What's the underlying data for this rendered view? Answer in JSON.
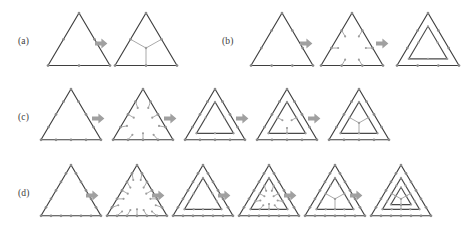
{
  "figure": {
    "background_color": "#ffffff",
    "edge_color": "#3f3f3f",
    "node_color": "#9d9d9d",
    "spoke_color": "#9a9a9a",
    "arrow_color": "#a0a0a0",
    "label_color": "#3b3b3b",
    "width": 476,
    "height": 235
  },
  "rows": [
    {
      "label": "(a)",
      "label_x": 18,
      "label_y": 36,
      "top": 8,
      "divisions": 2,
      "stage_count": 2,
      "stages": [
        {
          "x": 45,
          "size": 62,
          "divisions": 2,
          "nested": 0,
          "spokes": "none",
          "caption": ""
        },
        {
          "x": 112,
          "size": 62,
          "divisions": 2,
          "nested": 0,
          "spokes": "center",
          "caption": ""
        }
      ],
      "arrows": [
        {
          "x": 95,
          "y": 38
        }
      ]
    },
    {
      "label": "(b)",
      "label_x": 222,
      "label_y": 36,
      "top": 8,
      "divisions": 3,
      "stage_count": 3,
      "stages": [
        {
          "x": 248,
          "size": 62,
          "divisions": 3,
          "nested": 0,
          "spokes": "none",
          "caption": ""
        },
        {
          "x": 318,
          "size": 62,
          "divisions": 3,
          "nested": 0,
          "spokes": "stubs",
          "caption": ""
        },
        {
          "x": 394,
          "size": 62,
          "divisions": 3,
          "nested": 1,
          "spokes": "none",
          "caption": ""
        }
      ],
      "arrows": [
        {
          "x": 300,
          "y": 38
        },
        {
          "x": 376,
          "y": 38
        }
      ]
    },
    {
      "label": "(c)",
      "label_x": 18,
      "label_y": 112,
      "top": 84,
      "divisions": 4,
      "stage_count": 5,
      "stages": [
        {
          "x": 38,
          "size": 60,
          "divisions": 4,
          "nested": 0,
          "spokes": "none",
          "caption": ""
        },
        {
          "x": 110,
          "size": 60,
          "divisions": 4,
          "nested": 0,
          "spokes": "stubs",
          "caption": ""
        },
        {
          "x": 182,
          "size": 60,
          "divisions": 4,
          "nested": 1,
          "spokes": "none",
          "caption": ""
        },
        {
          "x": 254,
          "size": 60,
          "divisions": 4,
          "nested": 1,
          "spokes": "inner-stub",
          "caption": ""
        },
        {
          "x": 326,
          "size": 60,
          "divisions": 4,
          "nested": 1,
          "spokes": "inner-y",
          "caption": ""
        }
      ],
      "arrows": [
        {
          "x": 92,
          "y": 113
        },
        {
          "x": 164,
          "y": 113
        },
        {
          "x": 236,
          "y": 113
        },
        {
          "x": 308,
          "y": 113
        }
      ]
    },
    {
      "label": "(d)",
      "label_x": 18,
      "label_y": 188,
      "top": 160,
      "divisions": 6,
      "stage_count": 6,
      "stages": [
        {
          "x": 38,
          "size": 60,
          "divisions": 6,
          "nested": 0,
          "spokes": "none",
          "caption": ""
        },
        {
          "x": 104,
          "size": 60,
          "divisions": 6,
          "nested": 0,
          "spokes": "stubs",
          "caption": ""
        },
        {
          "x": 170,
          "size": 60,
          "divisions": 6,
          "nested": 1,
          "spokes": "none",
          "caption": ""
        },
        {
          "x": 236,
          "size": 60,
          "divisions": 6,
          "nested": 1,
          "spokes": "inner-stub",
          "caption": ""
        },
        {
          "x": 302,
          "size": 60,
          "divisions": 6,
          "nested": 1,
          "spokes": "inner-y",
          "caption": ""
        },
        {
          "x": 368,
          "size": 60,
          "divisions": 6,
          "nested": 2,
          "spokes": "core-y",
          "caption": ""
        }
      ],
      "arrows": [
        {
          "x": 86,
          "y": 190
        },
        {
          "x": 152,
          "y": 190
        },
        {
          "x": 218,
          "y": 190
        },
        {
          "x": 284,
          "y": 190
        },
        {
          "x": 350,
          "y": 190
        }
      ]
    }
  ]
}
